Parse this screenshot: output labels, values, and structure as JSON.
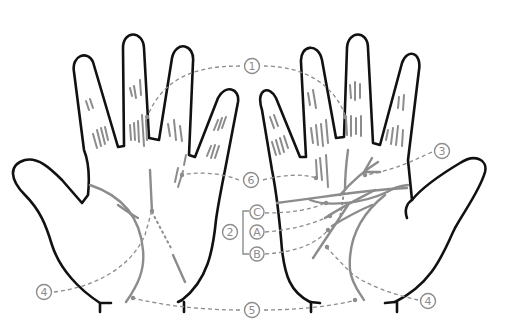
{
  "diagram": {
    "colors": {
      "outline": "#111111",
      "lines": "#8c8c8c",
      "background": "#ffffff"
    },
    "hands": [
      {
        "id": "left-hand",
        "description": "Left hand, palm view, few lines"
      },
      {
        "id": "right-hand",
        "description": "Right hand, palm view, many lines"
      }
    ],
    "labels": {
      "one": "1",
      "two": "2",
      "three": "3",
      "four_left": "4",
      "four_right": "4",
      "five": "5",
      "six": "6",
      "a": "A",
      "b": "B",
      "c": "C"
    }
  }
}
